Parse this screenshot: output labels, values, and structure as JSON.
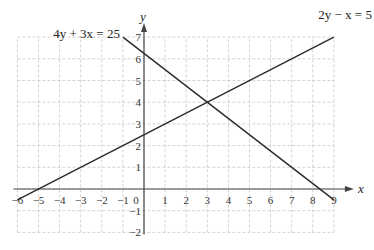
{
  "chart_data": {
    "type": "line",
    "title": "",
    "xlabel": "x",
    "ylabel": "y",
    "xlim": [
      -6,
      9
    ],
    "ylim": [
      -2,
      7
    ],
    "grid": true,
    "x_ticks": [
      -6,
      -5,
      -4,
      -3,
      -2,
      -1,
      0,
      1,
      2,
      3,
      4,
      5,
      6,
      7,
      8,
      9
    ],
    "y_ticks": [
      -2,
      -1,
      1,
      2,
      3,
      4,
      5,
      6,
      7
    ],
    "origin_label": "0",
    "series": [
      {
        "name": "4y + 3x = 25",
        "label": "4y + 3x = 25",
        "x": [
          -1,
          9
        ],
        "y": [
          7,
          -0.5
        ]
      },
      {
        "name": "2y − x = 5",
        "label": "2y − x = 5",
        "x": [
          -6,
          9
        ],
        "y": [
          -0.5,
          7
        ]
      }
    ],
    "intersection": {
      "x": 3,
      "y": 4
    }
  }
}
